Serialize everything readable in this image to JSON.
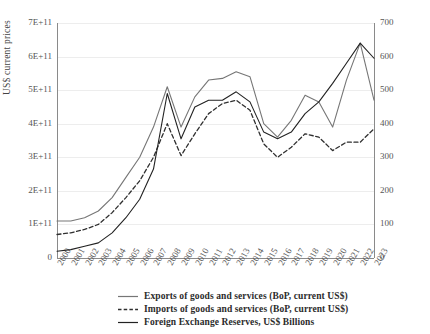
{
  "chart_data": {
    "type": "line",
    "title": "",
    "xlabel": "",
    "ylabel": "US$ current prices",
    "y2label": "",
    "grid": true,
    "legend_position": "bottom",
    "x": [
      "2000",
      "2001",
      "2002",
      "2003",
      "2004",
      "2005",
      "2006",
      "2007",
      "2008",
      "2009",
      "2010",
      "2011",
      "2012",
      "2013",
      "2014",
      "2015",
      "2016",
      "2017",
      "2018",
      "2019",
      "2020",
      "2021",
      "2022",
      "2023"
    ],
    "categories": [
      "2000",
      "2001",
      "2002",
      "2003",
      "2004",
      "2005",
      "2006",
      "2007",
      "2008",
      "2009",
      "2010",
      "2011",
      "2012",
      "2013",
      "2014",
      "2015",
      "2016",
      "2017",
      "2018",
      "2019",
      "2020",
      "2021",
      "2022",
      "2023"
    ],
    "ylim": [
      0,
      700000000000
    ],
    "yticks": [
      0,
      100000000000,
      200000000000,
      300000000000,
      400000000000,
      500000000000,
      600000000000,
      700000000000
    ],
    "ytick_labels": [
      "0",
      "1E+11",
      "2E+11",
      "3E+11",
      "4E+11",
      "5E+11",
      "6E+11",
      "7E+11"
    ],
    "y2lim": [
      0,
      700
    ],
    "y2ticks": [
      0,
      100,
      200,
      300,
      400,
      500,
      600,
      700
    ],
    "y2tick_labels": [
      "0",
      "100",
      "200",
      "300",
      "400",
      "500",
      "600",
      "700"
    ],
    "series": [
      {
        "name": "Exports of goods and services (BoP, current US$)",
        "axis": "left",
        "style": "solid",
        "color": "#767676",
        "values": [
          110000000000,
          110000000000,
          120000000000,
          140000000000,
          180000000000,
          240000000000,
          300000000000,
          390000000000,
          510000000000,
          390000000000,
          480000000000,
          530000000000,
          535000000000,
          555000000000,
          540000000000,
          400000000000,
          360000000000,
          410000000000,
          485000000000,
          465000000000,
          390000000000,
          530000000000,
          640000000000,
          470000000000
        ]
      },
      {
        "name": "Imports of goods and services (BoP, current US$)",
        "axis": "left",
        "style": "dashed",
        "color": "#2f2f2f",
        "values": [
          70000000000,
          75000000000,
          85000000000,
          100000000000,
          135000000000,
          180000000000,
          230000000000,
          300000000000,
          400000000000,
          305000000000,
          370000000000,
          430000000000,
          460000000000,
          470000000000,
          440000000000,
          340000000000,
          300000000000,
          330000000000,
          370000000000,
          360000000000,
          320000000000,
          345000000000,
          345000000000,
          385000000000
        ]
      },
      {
        "name": "Foreign Exchange Reserves, US$ Billions",
        "axis": "right",
        "style": "solid",
        "color": "#222222",
        "values": [
          20,
          25,
          35,
          45,
          75,
          120,
          175,
          265,
          490,
          355,
          450,
          470,
          470,
          495,
          465,
          375,
          355,
          375,
          430,
          465,
          520,
          580,
          640,
          595
        ]
      }
    ]
  },
  "axis": {
    "left_title": "US$ current prices",
    "left_ticks": [
      "7E+11",
      "6E+11",
      "5E+11",
      "4E+11",
      "3E+11",
      "2E+11",
      "1E+11",
      "0"
    ],
    "right_ticks": [
      "700",
      "600",
      "500",
      "400",
      "300",
      "200",
      "100",
      "0"
    ],
    "x_ticks": [
      "2000",
      "2001",
      "2002",
      "2003",
      "2004",
      "2005",
      "2006",
      "2007",
      "2008",
      "2009",
      "2010",
      "2011",
      "2012",
      "2013",
      "2014",
      "2015",
      "2016",
      "2017",
      "2018",
      "2019",
      "2020",
      "2021",
      "2022",
      "2023"
    ]
  },
  "legend": {
    "items": [
      {
        "label": "Exports of goods and services (BoP, current US$)",
        "style": "solid",
        "color": "#767676"
      },
      {
        "label": "Imports of goods and services (BoP, current US$)",
        "style": "dashed",
        "color": "#2f2f2f"
      },
      {
        "label": "Foreign Exchange Reserves, US$ Billions",
        "style": "solid",
        "color": "#222222"
      }
    ]
  }
}
